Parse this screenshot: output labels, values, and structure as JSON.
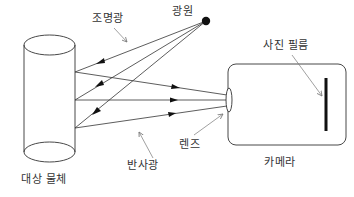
{
  "diagram": {
    "labels": {
      "illumination_light": "조명광",
      "light_source": "광원",
      "photo_film": "사진 필름",
      "lens": "렌즈",
      "reflected_light": "반사광",
      "camera": "카메라",
      "target_object": "대상 물체"
    },
    "colors": {
      "line": "#333333",
      "pointer": "#777777",
      "fill": "#111111",
      "background": "#ffffff"
    },
    "elements": {
      "light_source": {
        "shape": "filled-circle",
        "cx": 206,
        "cy": 21,
        "r": 4
      },
      "object": {
        "shape": "cylinder",
        "left": 24,
        "right": 75,
        "top": 45,
        "bottom": 152
      },
      "camera": {
        "shape": "rounded-rect",
        "x": 228,
        "y": 64,
        "w": 118,
        "h": 81
      },
      "lens": {
        "shape": "ellipse",
        "cx": 229,
        "cy": 100,
        "rx": 3,
        "ry": 12
      },
      "film": {
        "shape": "bar",
        "x": 326,
        "y1": 78,
        "y2": 131
      }
    },
    "rays": {
      "illumination": [
        {
          "from": [
            206,
            21
          ],
          "to": [
            75,
            72
          ]
        },
        {
          "from": [
            206,
            21
          ],
          "to": [
            75,
            100
          ]
        },
        {
          "from": [
            206,
            21
          ],
          "to": [
            75,
            128
          ]
        }
      ],
      "reflected": [
        {
          "from": [
            75,
            72
          ],
          "to": [
            227,
            95
          ]
        },
        {
          "from": [
            75,
            100
          ],
          "to": [
            227,
            100
          ]
        },
        {
          "from": [
            75,
            128
          ],
          "to": [
            227,
            106
          ]
        }
      ]
    }
  }
}
